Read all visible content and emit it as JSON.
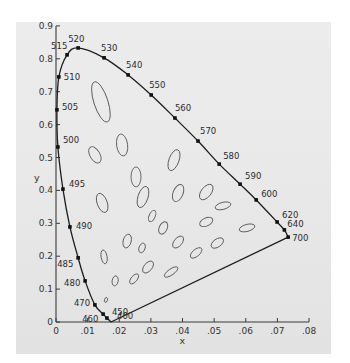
{
  "chart_data": {
    "type": "scatter",
    "title": "",
    "xlabel": "x",
    "ylabel": "y",
    "xlim": [
      0,
      0.08
    ],
    "ylim": [
      0,
      0.9
    ],
    "grid": false,
    "legend": null,
    "x_ticks": [
      "0",
      ".01",
      ".02",
      ".03",
      ".04",
      ".05",
      ".06",
      ".07",
      ".08"
    ],
    "y_ticks": [
      "0",
      "0.1",
      "0.2",
      "0.3",
      "0.4",
      "0.5",
      "0.6",
      "0.7",
      "0.8",
      "0.9"
    ],
    "spectral_locus": [
      {
        "wavelength": "400",
        "x": 0.0174,
        "y": 0.0
      },
      {
        "wavelength": "450",
        "x": 0.0161,
        "y": 0.012
      },
      {
        "wavelength": "460",
        "x": 0.0149,
        "y": 0.024
      },
      {
        "wavelength": "470",
        "x": 0.0123,
        "y": 0.052
      },
      {
        "wavelength": "480",
        "x": 0.0092,
        "y": 0.125
      },
      {
        "wavelength": "485",
        "x": 0.007,
        "y": 0.195
      },
      {
        "wavelength": "490",
        "x": 0.0044,
        "y": 0.289
      },
      {
        "wavelength": "495",
        "x": 0.0022,
        "y": 0.404
      },
      {
        "wavelength": "500",
        "x": 0.0006,
        "y": 0.532
      },
      {
        "wavelength": "505",
        "x": 0.0003,
        "y": 0.645
      },
      {
        "wavelength": "510",
        "x": 0.0009,
        "y": 0.745
      },
      {
        "wavelength": "515",
        "x": 0.0035,
        "y": 0.812
      },
      {
        "wavelength": "520",
        "x": 0.007,
        "y": 0.833
      },
      {
        "wavelength": "530",
        "x": 0.0152,
        "y": 0.803
      },
      {
        "wavelength": "540",
        "x": 0.0228,
        "y": 0.751
      },
      {
        "wavelength": "550",
        "x": 0.0301,
        "y": 0.69
      },
      {
        "wavelength": "560",
        "x": 0.0376,
        "y": 0.62
      },
      {
        "wavelength": "570",
        "x": 0.0449,
        "y": 0.55
      },
      {
        "wavelength": "580",
        "x": 0.0516,
        "y": 0.48
      },
      {
        "wavelength": "590",
        "x": 0.0582,
        "y": 0.419
      },
      {
        "wavelength": "600",
        "x": 0.0633,
        "y": 0.371
      },
      {
        "wavelength": "620",
        "x": 0.0699,
        "y": 0.304
      },
      {
        "wavelength": "640",
        "x": 0.0722,
        "y": 0.28
      },
      {
        "wavelength": "700",
        "x": 0.0734,
        "y": 0.258
      }
    ],
    "purple_line": [
      {
        "wavelength": "700",
        "x": 0.0734,
        "y": 0.258
      },
      {
        "wavelength": "400",
        "x": 0.0174,
        "y": 0.0
      }
    ],
    "ellipses": [
      {
        "cx": 0.0142,
        "cy": 0.669,
        "rx": 7,
        "ry": 21,
        "angle": -18
      },
      {
        "cx": 0.0209,
        "cy": 0.538,
        "rx": 5.5,
        "ry": 11,
        "angle": -8
      },
      {
        "cx": 0.0123,
        "cy": 0.508,
        "rx": 5,
        "ry": 9,
        "angle": -30
      },
      {
        "cx": 0.0253,
        "cy": 0.441,
        "rx": 5,
        "ry": 10,
        "angle": 0
      },
      {
        "cx": 0.0373,
        "cy": 0.492,
        "rx": 5,
        "ry": 11,
        "angle": 20
      },
      {
        "cx": 0.0146,
        "cy": 0.362,
        "rx": 5,
        "ry": 10,
        "angle": -20
      },
      {
        "cx": 0.0275,
        "cy": 0.38,
        "rx": 5,
        "ry": 11,
        "angle": 18
      },
      {
        "cx": 0.0386,
        "cy": 0.392,
        "rx": 5,
        "ry": 9,
        "angle": 22
      },
      {
        "cx": 0.0475,
        "cy": 0.395,
        "rx": 5,
        "ry": 9,
        "angle": 38
      },
      {
        "cx": 0.0304,
        "cy": 0.322,
        "rx": 3,
        "ry": 6,
        "angle": 25
      },
      {
        "cx": 0.0339,
        "cy": 0.286,
        "rx": 4,
        "ry": 6.5,
        "angle": 25
      },
      {
        "cx": 0.0528,
        "cy": 0.353,
        "rx": 8,
        "ry": 3.5,
        "angle": -15
      },
      {
        "cx": 0.0475,
        "cy": 0.304,
        "rx": 7,
        "ry": 4,
        "angle": -25
      },
      {
        "cx": 0.0604,
        "cy": 0.286,
        "rx": 8,
        "ry": 3.5,
        "angle": -15
      },
      {
        "cx": 0.0225,
        "cy": 0.246,
        "rx": 4,
        "ry": 7,
        "angle": 15
      },
      {
        "cx": 0.0272,
        "cy": 0.225,
        "rx": 3,
        "ry": 5,
        "angle": 20
      },
      {
        "cx": 0.0386,
        "cy": 0.243,
        "rx": 4,
        "ry": 7,
        "angle": 40
      },
      {
        "cx": 0.051,
        "cy": 0.24,
        "rx": 7,
        "ry": 4,
        "angle": -35
      },
      {
        "cx": 0.0152,
        "cy": 0.198,
        "rx": 3,
        "ry": 7,
        "angle": -10
      },
      {
        "cx": 0.0291,
        "cy": 0.167,
        "rx": 4,
        "ry": 7,
        "angle": 40
      },
      {
        "cx": 0.0364,
        "cy": 0.152,
        "rx": 3,
        "ry": 8,
        "angle": 55
      },
      {
        "cx": 0.0443,
        "cy": 0.21,
        "rx": 7,
        "ry": 3.5,
        "angle": -40
      },
      {
        "cx": 0.0187,
        "cy": 0.125,
        "rx": 3,
        "ry": 5,
        "angle": 10
      },
      {
        "cx": 0.0247,
        "cy": 0.131,
        "rx": 3,
        "ry": 6,
        "angle": 40
      },
      {
        "cx": 0.0158,
        "cy": 0.067,
        "rx": 1.5,
        "ry": 2.5,
        "angle": 20
      }
    ]
  },
  "axes": {
    "x_label": "x",
    "y_label": "y",
    "x_ticks": [
      {
        "label": "0",
        "value": 0
      },
      {
        "label": ".01",
        "value": 0.01
      },
      {
        "label": ".02",
        "value": 0.02
      },
      {
        "label": ".03",
        "value": 0.03
      },
      {
        "label": ".04",
        "value": 0.04
      },
      {
        "label": ".05",
        "value": 0.05
      },
      {
        "label": ".06",
        "value": 0.06
      },
      {
        "label": ".07",
        "value": 0.07
      },
      {
        "label": ".08",
        "value": 0.08
      }
    ],
    "y_ticks": [
      {
        "label": "0",
        "value": 0
      },
      {
        "label": "0.1",
        "value": 0.1
      },
      {
        "label": "0.2",
        "value": 0.2
      },
      {
        "label": "0.3",
        "value": 0.3
      },
      {
        "label": "0.4",
        "value": 0.4
      },
      {
        "label": "0.5",
        "value": 0.5
      },
      {
        "label": "0.6",
        "value": 0.6
      },
      {
        "label": "0.7",
        "value": 0.7
      },
      {
        "label": "0.8",
        "value": 0.8
      },
      {
        "label": "0.9",
        "value": 0.9
      }
    ]
  },
  "wavelength_labels": [
    {
      "text": "520",
      "dx": -10,
      "dy": -6
    },
    {
      "text": "515",
      "dx": -16,
      "dy": -6
    },
    {
      "text": "510",
      "dx": 5,
      "dy": 3
    },
    {
      "text": "505",
      "dx": 5,
      "dy": 0
    },
    {
      "text": "500",
      "dx": 5,
      "dy": -4
    },
    {
      "text": "495",
      "dx": 6,
      "dy": -2
    },
    {
      "text": "490",
      "dx": 6,
      "dy": 2
    },
    {
      "text": "485",
      "dx": -21,
      "dy": 9
    },
    {
      "text": "480",
      "dx": -21,
      "dy": 5
    },
    {
      "text": "470",
      "dx": -21,
      "dy": 1
    },
    {
      "text": "460",
      "dx": -21,
      "dy": 8
    },
    {
      "text": "450",
      "dx": 5,
      "dy": -3
    },
    {
      "text": "400",
      "dx": 6,
      "dy": -3
    },
    {
      "text": "530",
      "dx": -3,
      "dy": -7
    },
    {
      "text": "540",
      "dx": -2,
      "dy": -7
    },
    {
      "text": "550",
      "dx": -2,
      "dy": -7
    },
    {
      "text": "560",
      "dx": 0,
      "dy": -7
    },
    {
      "text": "570",
      "dx": 2,
      "dy": -7
    },
    {
      "text": "580",
      "dx": 4,
      "dy": -5
    },
    {
      "text": "590",
      "dx": 5,
      "dy": -5
    },
    {
      "text": "600",
      "dx": 5,
      "dy": -3
    },
    {
      "text": "620",
      "dx": 5,
      "dy": -4
    },
    {
      "text": "640",
      "dx": 3,
      "dy": -3
    },
    {
      "text": "700",
      "dx": 4,
      "dy": 4
    }
  ],
  "colors": {
    "background": "#e9e9e9",
    "curve": "#1c1c1c",
    "ellipse_stroke": "#5a5a5a",
    "text": "#333333"
  }
}
